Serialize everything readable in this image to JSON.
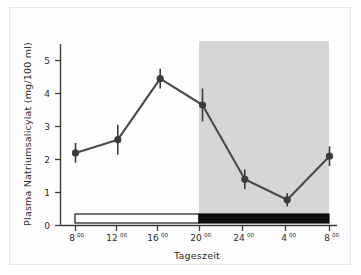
{
  "figure": {
    "background_color": "#ffffff",
    "frame_color": "#e7e7e7",
    "line_color": "#4a4a4a",
    "marker_color": "#3b3b3b",
    "night_band_color": "#d4d4d4",
    "daybar_fill": "#ffffff",
    "nightbar_fill": "#0d0d0d"
  },
  "chart_data": {
    "type": "line",
    "title": "",
    "subtitle": "",
    "xlabel": "Tageszeit",
    "ylabel": "Plasma Natriumsalicylat (mg/100 ml)",
    "x_tick_labels": [
      "8",
      "12",
      "16",
      "20",
      "24",
      "4",
      "8"
    ],
    "x_tick_superscript": "00",
    "x_tick_labels_full": [
      "8⁰⁰",
      "12⁰⁰",
      "16⁰⁰",
      "20⁰⁰",
      "24⁰⁰",
      "4⁰⁰",
      "8⁰⁰"
    ],
    "y_tick_labels": [
      "0",
      "1",
      "2",
      "3",
      "4",
      "5"
    ],
    "y_ticks": [
      0,
      1,
      2,
      3,
      4,
      5
    ],
    "ylim": [
      0,
      5.5
    ],
    "xlim": [
      0,
      6
    ],
    "grid": false,
    "legend": null,
    "categories": [
      "8:00",
      "12:00",
      "16:00",
      "20:00",
      "24:00",
      "4:00",
      "8:00"
    ],
    "values": [
      2.2,
      2.6,
      4.45,
      3.65,
      1.4,
      0.78,
      2.1
    ],
    "errors": [
      0.3,
      0.45,
      0.3,
      0.5,
      0.3,
      0.2,
      0.3
    ],
    "series": [
      {
        "name": "Plasma Natriumsalicylat",
        "values": [
          2.2,
          2.6,
          4.45,
          3.65,
          1.4,
          0.78,
          2.1
        ],
        "errors": [
          0.3,
          0.45,
          0.3,
          0.5,
          0.3,
          0.2,
          0.3
        ]
      }
    ],
    "annotations": [
      {
        "name": "day-phase-bar",
        "label": "day",
        "x_start": "8:00",
        "x_end": "20:00",
        "style": "white bar with black outline"
      },
      {
        "name": "night-phase-bar",
        "label": "night",
        "x_start": "20:00",
        "x_end": "8:00",
        "style": "solid black bar"
      },
      {
        "name": "night-shaded-region",
        "label": "dark phase",
        "x_start": "20:00",
        "x_end": "8:00",
        "style": "gray shaded background"
      }
    ]
  }
}
